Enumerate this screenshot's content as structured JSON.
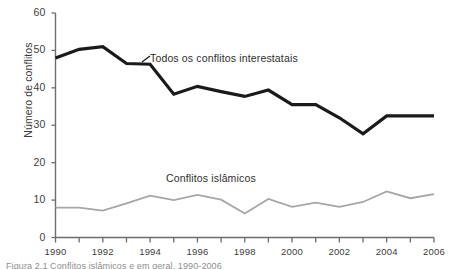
{
  "figure": {
    "caption_clipped": "Figura 2.1  Conflitos islâmicos e em geral, 1990-2006"
  },
  "chart_data": {
    "type": "line",
    "title": "",
    "xlabel": "",
    "ylabel": "Número de conflitos",
    "xlim": [
      1990,
      2006
    ],
    "ylim": [
      0,
      60
    ],
    "grid": false,
    "legend_position": "inline-annotation",
    "y_ticks": [
      "0",
      "10",
      "20",
      "30",
      "40",
      "50",
      "60"
    ],
    "y_tick_values": [
      0,
      10,
      20,
      30,
      40,
      50,
      60
    ],
    "x_ticks_all": [
      1990,
      1991,
      1992,
      1993,
      1994,
      1995,
      1996,
      1997,
      1998,
      1999,
      2000,
      2001,
      2002,
      2003,
      2004,
      2005,
      2006
    ],
    "x_tick_labels": [
      "1990",
      "1992",
      "1994",
      "1996",
      "1998",
      "2000",
      "2002",
      "2004",
      "2006"
    ],
    "x_tick_label_values": [
      1990,
      1992,
      1994,
      1996,
      1998,
      2000,
      2002,
      2004,
      2006
    ],
    "x": [
      1990,
      1991,
      1992,
      1993,
      1994,
      1995,
      1996,
      1997,
      1998,
      1999,
      2000,
      2001,
      2002,
      2003,
      2004,
      2005,
      2006
    ],
    "series": [
      {
        "name": "Todos os conflitos interestatais",
        "color": "#1a1a1a",
        "width": 3.2,
        "values": [
          48.0,
          50.3,
          51.0,
          46.5,
          46.3,
          38.3,
          40.4,
          39.0,
          37.7,
          39.4,
          35.5,
          35.5,
          32.0,
          27.7,
          32.5,
          32.5,
          32.5
        ]
      },
      {
        "name": "Conflitos islâmicos",
        "color": "#a6a6a6",
        "width": 1.8,
        "values": [
          8.0,
          8.0,
          7.2,
          9.1,
          11.2,
          10.0,
          11.4,
          10.1,
          6.4,
          10.3,
          8.2,
          9.3,
          8.2,
          9.5,
          12.3,
          10.5,
          11.6
        ]
      }
    ],
    "annotations": [
      {
        "text": "Todos os conflitos interestatais",
        "series": "Todos os conflitos interestatais"
      },
      {
        "text": "Conflitos islâmicos",
        "series": "Conflitos islâmicos"
      }
    ]
  }
}
